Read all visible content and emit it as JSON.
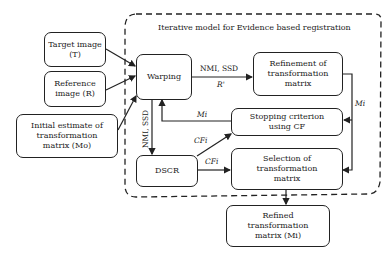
{
  "title": "Iterative model for Evidence based registration",
  "nodes": {
    "target": "Target image (T)",
    "reference": "Reference image (R)",
    "initial": "Initial estimate of transformation matrix (Mo)",
    "warping": "Warping",
    "refinement": "Refinement of transformation matrix",
    "stopping": "Stopping criterion using CF",
    "dscr": "DSCR",
    "selection": "Selection of transformation matrix",
    "refined": "Refined transformation matrix (Mi)"
  },
  "edge_labels": {
    "warp_to_refine_top": "NMI, SSD",
    "warp_to_refine_bottom": "R'",
    "stop_to_warp": "Mi",
    "refine_to_right": "Mi",
    "warp_to_dscr": "NMI, SSD",
    "dscr_to_stop": "CFi",
    "dscr_to_select": "CFi"
  }
}
